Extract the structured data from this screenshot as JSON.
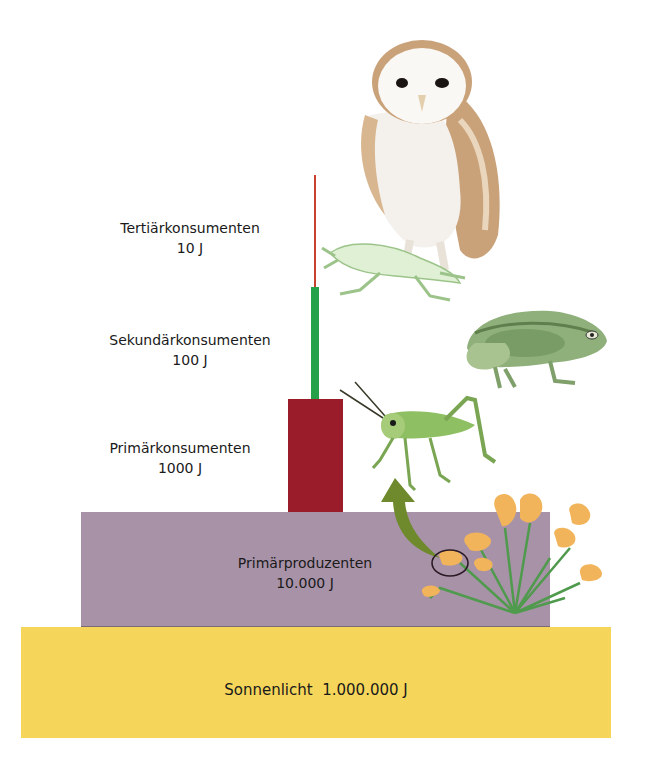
{
  "diagram": {
    "type": "energy-pyramid",
    "language": "de",
    "levels": [
      {
        "id": "sunlight",
        "name": "Sonnenlicht",
        "energy": "1.000.000 J",
        "color": "#f5d65a"
      },
      {
        "id": "producers",
        "name": "Primärproduzenten",
        "energy": "10.000 J",
        "color": "#a892a8"
      },
      {
        "id": "primary",
        "name": "Primärkonsumenten",
        "energy": "1000 J",
        "color": "#9a1c2a"
      },
      {
        "id": "secondary",
        "name": "Sekundärkonsumenten",
        "energy": "100 J",
        "color": "#27a04a"
      },
      {
        "id": "tertiary",
        "name": "Tertiärkonsumenten",
        "energy": "10 J",
        "color": "#c8402e"
      }
    ],
    "sunlight_label": "Sonnenlicht  1.000.000 J",
    "illustrations": [
      {
        "id": "barn-owl",
        "represents": "Tertiärkonsumenten"
      },
      {
        "id": "frog-prey",
        "represents": "Sekundärkonsumenten"
      },
      {
        "id": "toad",
        "represents": "Sekundärkonsumenten"
      },
      {
        "id": "grasshopper",
        "represents": "Primärkonsumenten"
      },
      {
        "id": "poppy-plant",
        "represents": "Primärproduzenten"
      }
    ],
    "arrow_color": "#6e8a2c"
  }
}
